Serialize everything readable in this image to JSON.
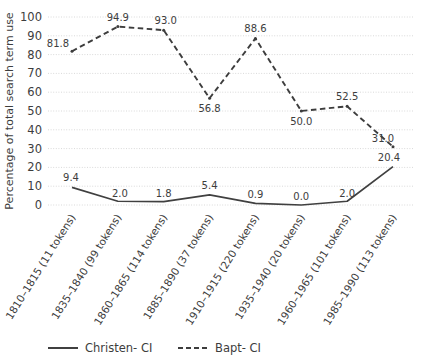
{
  "chart_data": {
    "type": "line",
    "title": "",
    "xlabel": "",
    "ylabel": "Percentage of total search term use",
    "ylim": [
      0,
      100
    ],
    "ytick_step": 10,
    "yticks": [
      "0",
      "10",
      "20",
      "30",
      "40",
      "50",
      "60",
      "70",
      "80",
      "90",
      "100"
    ],
    "grid": true,
    "legend_position": "bottom",
    "categories": [
      "1810–1815 (11 tokens)",
      "1835–1840 (99 tokens)",
      "1860–1865 (114 tokens)",
      "1885–1890 (37 tokens)",
      "1910–1915 (220 tokens)",
      "1935–1940 (20 tokens)",
      "1960–1965 (101 tokens)",
      "1985–1990 (113 tokens)"
    ],
    "series": [
      {
        "name": "Christen- CI",
        "style": "solid",
        "color": "#404040",
        "values": [
          9.4,
          2.0,
          1.8,
          5.4,
          0.9,
          0.0,
          2.0,
          20.4
        ],
        "labels": [
          "9.4",
          "2.0",
          "1.8",
          "5.4",
          "0.9",
          "0.0",
          "2.0",
          "20.4"
        ]
      },
      {
        "name": "Bapt- CI",
        "style": "dashed",
        "color": "#3d3d3d",
        "values": [
          81.8,
          94.9,
          93.0,
          56.8,
          88.6,
          50.0,
          52.5,
          31.0
        ],
        "labels": [
          "81.8",
          "94.9",
          "93.0",
          "56.8",
          "88.6",
          "50.0",
          "52.5",
          "31.0"
        ]
      }
    ]
  },
  "legend": {
    "items": [
      {
        "label": "Christen- CI"
      },
      {
        "label": "Bapt- CI"
      }
    ]
  },
  "colors": {
    "grid": "#d9d9d9",
    "text": "#3d3d3d",
    "series_solid": "#404040",
    "series_dashed": "#3d3d3d",
    "background": "#ffffff"
  }
}
